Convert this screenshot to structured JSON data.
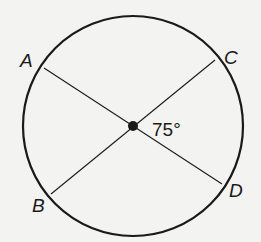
{
  "diagram": {
    "type": "circle-with-intersecting-diameters",
    "points": {
      "A": "A",
      "B": "B",
      "C": "C",
      "D": "D"
    },
    "angle_label": "75°",
    "colors": {
      "stroke": "#1a1a1a",
      "background": "#f3f3f1"
    }
  }
}
